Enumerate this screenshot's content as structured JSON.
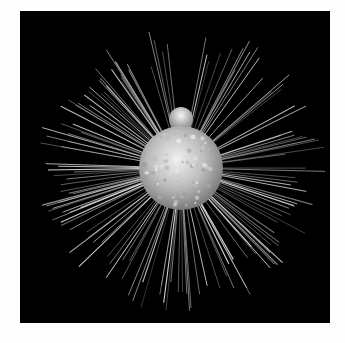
{
  "image": {
    "subject": "radiolarian microorganism with radiating spines",
    "background_color": "#000000",
    "page_color": "#fefefe",
    "frame": {
      "x": 20,
      "y": 11,
      "width": 310,
      "height": 312
    },
    "body": {
      "cx": 161,
      "cy": 157,
      "r": 42,
      "color": "#c8c8c8"
    },
    "bulb": {
      "cx": 161,
      "cy": 108,
      "r": 12,
      "color": "#b8b8b8"
    },
    "spines": {
      "count": 150,
      "min_length": 105,
      "max_length": 145,
      "color": "#e0e0e0",
      "seed": 7
    }
  }
}
